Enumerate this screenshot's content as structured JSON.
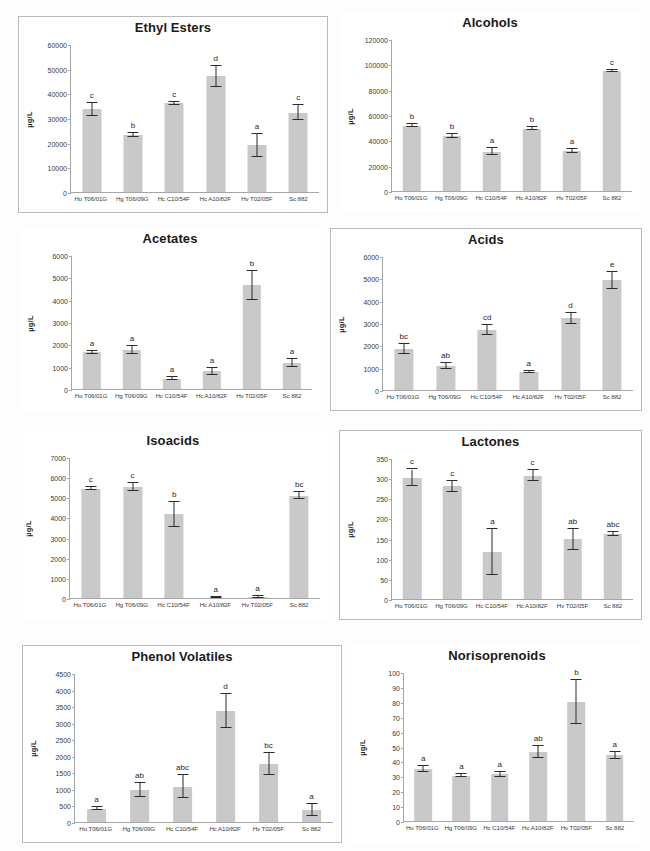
{
  "figure": {
    "ylabel": "µg/L",
    "categories": [
      "Ho T06/01G",
      "Hg T06/09G",
      "Hc C10/54F",
      "Hc A10/82F",
      "Hv T02/05F",
      "Sc 882"
    ],
    "bar_color": "#c9c9c9",
    "error_color": "#2b2b2b",
    "axis_color": "#a6a6a6"
  },
  "chart_data": [
    {
      "type": "bar",
      "title": "Ethyl Esters",
      "xlabel": "",
      "ylabel": "µg/L",
      "categories": [
        "Ho T06/01G",
        "Hg T06/09G",
        "Hc C10/54F",
        "Hc A10/82F",
        "Hv T02/05F",
        "Sc 882"
      ],
      "values": [
        33900,
        23600,
        36400,
        47300,
        19300,
        32500
      ],
      "errors": [
        2600,
        900,
        700,
        4300,
        4600,
        3100
      ],
      "labels": [
        "c",
        "b",
        "c",
        "d",
        "a",
        "c"
      ],
      "ylim": [
        0,
        60000
      ],
      "yticks": [
        0,
        10000,
        20000,
        30000,
        40000,
        50000,
        60000
      ],
      "grid": false,
      "legend": "none"
    },
    {
      "type": "bar",
      "title": "Alcohols",
      "xlabel": "",
      "ylabel": "µg/L",
      "categories": [
        "Ho T06/01G",
        "Hg T06/09G",
        "Hc C10/54F",
        "Hc A10/82F",
        "Hv T02/05F",
        "Sc 882"
      ],
      "values": [
        52500,
        44200,
        31800,
        50000,
        32500,
        95800
      ],
      "errors": [
        900,
        1700,
        2700,
        1000,
        1700,
        700
      ],
      "labels": [
        "b",
        "b",
        "a",
        "b",
        "a",
        "c"
      ],
      "ylim": [
        0,
        120000
      ],
      "yticks": [
        0,
        20000,
        40000,
        60000,
        80000,
        100000,
        120000
      ],
      "grid": false,
      "legend": "none"
    },
    {
      "type": "bar",
      "title": "Acetates",
      "xlabel": "",
      "ylabel": "µg/L",
      "categories": [
        "Ho T06/01G",
        "Hg T06/09G",
        "Hc C10/54F",
        "Hc A10/82F",
        "Hv T02/05F",
        "Sc 882"
      ],
      "values": [
        1690,
        1790,
        500,
        840,
        4680,
        1220
      ],
      "errors": [
        60,
        180,
        70,
        150,
        670,
        180
      ],
      "labels": [
        "a",
        "a",
        "a",
        "a",
        "b",
        "a"
      ],
      "ylim": [
        0,
        6000
      ],
      "yticks": [
        0,
        1000,
        2000,
        3000,
        4000,
        5000,
        6000
      ],
      "grid": false,
      "legend": "none"
    },
    {
      "type": "bar",
      "title": "Acids",
      "xlabel": "",
      "ylabel": "µg/L",
      "categories": [
        "Ho T06/01G",
        "Hg T06/09G",
        "Hc C10/54F",
        "Hc A10/82F",
        "Hv T02/05F",
        "Sc 882"
      ],
      "values": [
        1880,
        1110,
        2730,
        850,
        3250,
        4960
      ],
      "errors": [
        230,
        130,
        220,
        60,
        260,
        380
      ],
      "labels": [
        "bc",
        "ab",
        "cd",
        "a",
        "d",
        "e"
      ],
      "ylim": [
        0,
        6000
      ],
      "yticks": [
        0,
        1000,
        2000,
        3000,
        4000,
        5000,
        6000
      ],
      "grid": false,
      "legend": "none"
    },
    {
      "type": "bar",
      "title": "Isoacids",
      "xlabel": "",
      "ylabel": "µg/L",
      "categories": [
        "Ho T06/01G",
        "Hg T06/09G",
        "Hc C10/54F",
        "Hc A10/82F",
        "Hv T02/05F",
        "Sc 882"
      ],
      "values": [
        5480,
        5550,
        4200,
        70,
        100,
        5130
      ],
      "errors": [
        90,
        200,
        640,
        40,
        50,
        180
      ],
      "labels": [
        "c",
        "c",
        "b",
        "a",
        "a",
        "bc"
      ],
      "ylim": [
        0,
        7000
      ],
      "yticks": [
        0,
        1000,
        2000,
        3000,
        4000,
        5000,
        6000,
        7000
      ],
      "grid": false,
      "legend": "none"
    },
    {
      "type": "bar",
      "title": "Lactones",
      "xlabel": "",
      "ylabel": "µg/L",
      "categories": [
        "Ho T06/01G",
        "Hg T06/09G",
        "Hc C10/54F",
        "Hc A10/82F",
        "Hv T02/05F",
        "Sc 882"
      ],
      "values": [
        303,
        282,
        119,
        309,
        151,
        164
      ],
      "errors": [
        21,
        13,
        57,
        14,
        26,
        6
      ],
      "labels": [
        "c",
        "c",
        "a",
        "c",
        "ab",
        "abc"
      ],
      "ylim": [
        0,
        350
      ],
      "yticks": [
        0,
        50,
        100,
        150,
        200,
        250,
        300,
        350
      ],
      "grid": false,
      "legend": "none"
    },
    {
      "type": "bar",
      "title": "Phenol Volatiles",
      "xlabel": "",
      "ylabel": "µg/L",
      "categories": [
        "Ho T06/01G",
        "Hg T06/09G",
        "Hc C10/54F",
        "Hc A10/82F",
        "Hv T02/05F",
        "Sc 882"
      ],
      "values": [
        430,
        1000,
        1100,
        3390,
        1780,
        400
      ],
      "errors": [
        40,
        210,
        340,
        520,
        330,
        180
      ],
      "labels": [
        "a",
        "ab",
        "abc",
        "d",
        "bc",
        "a"
      ],
      "ylim": [
        0,
        4500
      ],
      "yticks": [
        0,
        500,
        1000,
        1500,
        2000,
        2500,
        3000,
        3500,
        4000,
        4500
      ],
      "grid": false,
      "legend": "none"
    },
    {
      "type": "bar",
      "title": "Norisoprenoids",
      "xlabel": "",
      "ylabel": "µg/L",
      "categories": [
        "Ho T06/01G",
        "Hg T06/09G",
        "Hc C10/54F",
        "Hc A10/82F",
        "Hv T02/05F",
        "Sc 882"
      ],
      "values": [
        35.3,
        31.2,
        32.0,
        47.0,
        80.5,
        44.8
      ],
      "errors": [
        2.0,
        1.2,
        1.8,
        4.0,
        14.5,
        2.2
      ],
      "labels": [
        "a",
        "a",
        "a",
        "ab",
        "b",
        "a"
      ],
      "ylim": [
        0,
        100
      ],
      "yticks": [
        0,
        10,
        20,
        30,
        40,
        50,
        60,
        70,
        80,
        90,
        100
      ],
      "grid": false,
      "legend": "none"
    }
  ],
  "panels": [
    {
      "name": "panel-ethyl-esters",
      "framed": true,
      "x": 18,
      "y": 16,
      "w": 310,
      "h": 197
    },
    {
      "name": "panel-alcohols",
      "framed": false,
      "x": 340,
      "y": 12,
      "w": 300,
      "h": 201
    },
    {
      "name": "panel-acetates",
      "framed": false,
      "x": 20,
      "y": 228,
      "w": 300,
      "h": 183
    },
    {
      "name": "panel-acids",
      "framed": true,
      "x": 330,
      "y": 228,
      "w": 312,
      "h": 183
    },
    {
      "name": "panel-isoacids",
      "framed": false,
      "x": 18,
      "y": 430,
      "w": 310,
      "h": 190
    },
    {
      "name": "panel-lactones",
      "framed": true,
      "x": 339,
      "y": 430,
      "w": 303,
      "h": 190
    },
    {
      "name": "panel-phenol-volatiles",
      "framed": true,
      "x": 22,
      "y": 645,
      "w": 320,
      "h": 198
    },
    {
      "name": "panel-norisoprenoids",
      "framed": false,
      "x": 352,
      "y": 645,
      "w": 290,
      "h": 198
    }
  ]
}
